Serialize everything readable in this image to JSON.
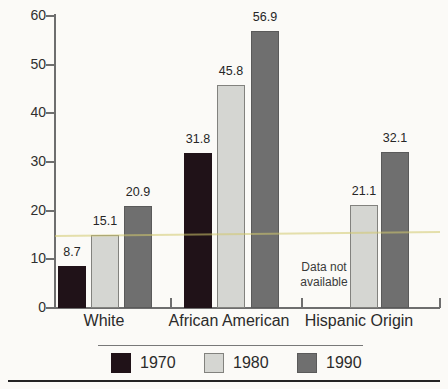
{
  "chart_data": {
    "type": "bar",
    "title": "",
    "categories": [
      "White",
      "African American",
      "Hispanic Origin"
    ],
    "series": [
      {
        "name": "1970",
        "color": "#201218",
        "values": [
          8.7,
          31.8,
          null
        ]
      },
      {
        "name": "1980",
        "color": "#d5d6d2",
        "values": [
          15.1,
          45.8,
          21.1
        ]
      },
      {
        "name": "1990",
        "color": "#6f6f6f",
        "values": [
          20.9,
          56.9,
          32.1
        ]
      }
    ],
    "value_labels": true,
    "missing_note": "Data not available",
    "ylim": [
      0,
      60
    ],
    "yticks": [
      0,
      10,
      20,
      30,
      40,
      50,
      60
    ],
    "legend_position": "bottom",
    "grid": false
  },
  "colors": {
    "axis": "#6e6e6e",
    "text": "#2b2b2b",
    "background": "#fbfaf7",
    "bar_1970": "#201218",
    "bar_1980": "#d5d6d2",
    "bar_1990": "#6f6f6f",
    "scan_artifact_line": "#d2c86e",
    "bottom_rule": "#242424"
  }
}
